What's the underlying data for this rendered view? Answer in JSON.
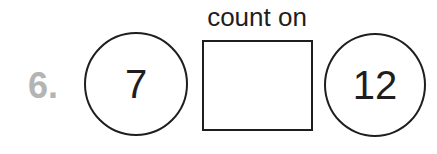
{
  "problem": {
    "number": "6.",
    "instruction": "count on",
    "start_value": "7",
    "answer_box": "",
    "end_value": "12"
  }
}
